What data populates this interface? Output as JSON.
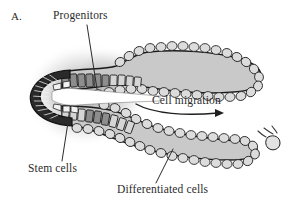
{
  "figure": {
    "panel_letter": "A.",
    "labels": {
      "progenitors": "Progenitors",
      "cell_migration": "Cell migration",
      "stem_cells": "Stem cells",
      "differentiated_cells": "Differentiated cells"
    },
    "colors": {
      "background": "#ffffff",
      "text": "#2b2b2b",
      "outline": "#1a1a1a",
      "tissue_fill": "#c9c9c9",
      "halo_shadow": "#b5b5b5",
      "stem_zone_fill": "#2a2a2a",
      "progenitor_cell_fill": "#8f8f8f",
      "lumen_fill": "#ffffff",
      "differentiated_cell_fill": "#d8d8d8"
    },
    "structure": {
      "shape": "hairpin-crypt-villus-axis",
      "stem_zone_position": "left-tip",
      "arms": [
        "upper-villus",
        "lower-villus"
      ],
      "shed_cell_position": "right-of-lower-arm",
      "migration_direction": "left-to-right"
    }
  }
}
